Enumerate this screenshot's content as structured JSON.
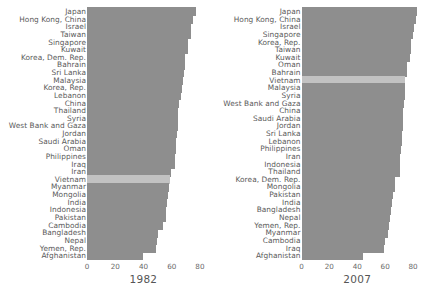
{
  "chart_data": {
    "type": "bar",
    "orientation": "horizontal",
    "title": "",
    "xlabel": "",
    "ylabel": "",
    "xlim": [
      0,
      85
    ],
    "grid": false,
    "legend": null,
    "xticks": [
      0,
      20,
      40,
      60,
      80
    ],
    "highlight_category": "Vietnam",
    "highlight_color": "#c2c2c2",
    "bar_color": "#8e8e8e",
    "panels": [
      {
        "name": "panel-1982",
        "title": "1982",
        "categories": [
          "Japan",
          "Hong Kong, China",
          "Israel",
          "Taiwan",
          "Singapore",
          "Kuwait",
          "Korea, Dem. Rep.",
          "Bahrain",
          "Sri Lanka",
          "Malaysia",
          "Korea, Rep.",
          "Lebanon",
          "China",
          "Thailand",
          "Syria",
          "West Bank and Gaza",
          "Jordan",
          "Saudi Arabia",
          "Oman",
          "Philippines",
          "Iraq",
          "Iran",
          "Vietnam",
          "Myanmar",
          "Mongolia",
          "India",
          "Indonesia",
          "Pakistan",
          "Cambodia",
          "Bangladesh",
          "Nepal",
          "Yemen, Rep.",
          "Afghanistan"
        ],
        "values": [
          77.1,
          75.4,
          73.9,
          73.4,
          71.8,
          71.3,
          69.1,
          69.1,
          69.0,
          68.0,
          67.1,
          66.9,
          65.5,
          64.6,
          64.6,
          64.4,
          63.7,
          63.0,
          62.7,
          62.1,
          62.0,
          59.6,
          58.6,
          58.1,
          57.5,
          56.6,
          56.2,
          56.2,
          53.9,
          50.0,
          49.6,
          49.1,
          39.9
        ]
      },
      {
        "name": "panel-2007",
        "title": "2007",
        "categories": [
          "Japan",
          "Hong Kong, China",
          "Israel",
          "Singapore",
          "Korea, Rep.",
          "Taiwan",
          "Kuwait",
          "Oman",
          "Bahrain",
          "Vietnam",
          "Malaysia",
          "Syria",
          "West Bank and Gaza",
          "China",
          "Saudi Arabia",
          "Jordan",
          "Sri Lanka",
          "Lebanon",
          "Philippines",
          "Iran",
          "Indonesia",
          "Thailand",
          "Korea, Dem. Rep.",
          "Mongolia",
          "Pakistan",
          "India",
          "Bangladesh",
          "Nepal",
          "Yemen, Rep.",
          "Myanmar",
          "Cambodia",
          "Iraq",
          "Afghanistan"
        ],
        "values": [
          82.6,
          82.2,
          80.7,
          80.0,
          78.6,
          78.4,
          77.6,
          75.6,
          75.6,
          74.2,
          74.2,
          74.1,
          73.4,
          73.0,
          72.8,
          72.5,
          72.4,
          71.9,
          71.7,
          71.0,
          70.6,
          70.6,
          67.3,
          66.8,
          65.5,
          64.7,
          64.1,
          63.8,
          62.7,
          62.1,
          59.7,
          59.5,
          43.8
        ]
      }
    ]
  }
}
